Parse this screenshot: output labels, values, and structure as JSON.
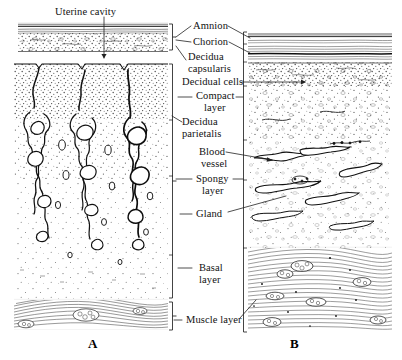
{
  "figure": {
    "title_alt": "Comparative histology of decidua capsularis and decidua parietalis",
    "ink_color": "#1a1a1a",
    "background_color": "#ffffff",
    "stipple_color": "#4a4a4a"
  },
  "panels": [
    {
      "id": "A",
      "letter": "A",
      "x": 88,
      "y": 336,
      "description": "Decidua capsularis with underlying uterine cavity and decidua parietalis showing tortuous glands"
    },
    {
      "id": "B",
      "letter": "B",
      "x": 290,
      "y": 336,
      "description": "Decidua parietalis in full thickness with amnion and chorion apposed"
    }
  ],
  "labels": [
    {
      "key": "uterine_cavity",
      "lines": [
        "Uterine cavity"
      ],
      "x": 55,
      "y": 6,
      "align": "left",
      "name": "label-uterine-cavity"
    },
    {
      "key": "amnion",
      "lines": [
        "Amnion"
      ],
      "x": 193,
      "y": 22,
      "align": "left",
      "name": "label-amnion"
    },
    {
      "key": "chorion",
      "lines": [
        "Chorion"
      ],
      "x": 193,
      "y": 38,
      "align": "left",
      "name": "label-chorion"
    },
    {
      "key": "decidua_capsularis",
      "lines": [
        "Decidua",
        "capsularis"
      ],
      "x": 188,
      "y": 52,
      "align": "left",
      "name": "label-decidua-capsularis"
    },
    {
      "key": "decidual_cells",
      "lines": [
        "Decidual cells"
      ],
      "x": 186,
      "y": 78,
      "align": "left",
      "name": "label-decidual-cells"
    },
    {
      "key": "compact_layer",
      "lines": [
        "Compact",
        "layer"
      ],
      "x": 196,
      "y": 92,
      "align": "left",
      "name": "label-compact-layer"
    },
    {
      "key": "decidua_parietalis",
      "lines": [
        "Decidua",
        "parietalis"
      ],
      "x": 184,
      "y": 117,
      "align": "left",
      "name": "label-decidua-parietalis"
    },
    {
      "key": "blood_vessel",
      "lines": [
        "Blood",
        "vessel"
      ],
      "x": 199,
      "y": 145,
      "align": "left",
      "name": "label-blood-vessel"
    },
    {
      "key": "spongy_layer",
      "lines": [
        "Spongy",
        "layer"
      ],
      "x": 196,
      "y": 174,
      "align": "left",
      "name": "label-spongy-layer"
    },
    {
      "key": "gland",
      "lines": [
        "Gland"
      ],
      "x": 196,
      "y": 210,
      "align": "left",
      "name": "label-gland"
    },
    {
      "key": "basal_layer",
      "lines": [
        "Basal",
        "layer"
      ],
      "x": 196,
      "y": 263,
      "align": "left",
      "name": "label-basal-layer"
    },
    {
      "key": "muscle_layer",
      "lines": [
        "Muscle layer"
      ],
      "x": 186,
      "y": 316,
      "align": "left",
      "name": "label-muscle-layer"
    }
  ],
  "structures": {
    "panel_a": {
      "membrane_block": {
        "top": 22,
        "bottom": 52,
        "left": 18,
        "right": 168,
        "sublayers": [
          "amnion epithelium",
          "chorion fibrous bands",
          "decidua capsularis stipple"
        ]
      },
      "cavity_gap": {
        "top": 52,
        "bottom": 62,
        "note": "uterine cavity slit between capsularis and parietalis"
      },
      "parietalis_block": {
        "top": 62,
        "bottom": 300,
        "left": 14,
        "right": 168
      },
      "muscle_block": {
        "top": 300,
        "bottom": 330,
        "left": 14,
        "right": 168
      },
      "layer_boundaries": {
        "compact": 120,
        "spongy": 255,
        "basal": 300
      }
    },
    "panel_b": {
      "block": {
        "top": 32,
        "bottom": 332,
        "left": 248,
        "right": 392
      },
      "layer_boundaries": {
        "amnion": 44,
        "chorion": 62,
        "decidual_cells": 86,
        "compact": 140,
        "spongy": 235,
        "basal": 248,
        "muscle": 332
      }
    }
  },
  "brackets": [
    {
      "name": "bracket-a-membrane",
      "side": "right-of-a",
      "x": 172,
      "top": 24,
      "bottom": 52
    },
    {
      "name": "bracket-a-decidua",
      "side": "right-of-a",
      "x": 172,
      "top": 64,
      "bottom": 298
    },
    {
      "name": "bracket-a-muscle",
      "side": "right-of-a",
      "x": 172,
      "top": 302,
      "bottom": 330
    },
    {
      "name": "bracket-b-full",
      "side": "left-of-b",
      "x": 244,
      "top": 32,
      "bottom": 332
    }
  ]
}
